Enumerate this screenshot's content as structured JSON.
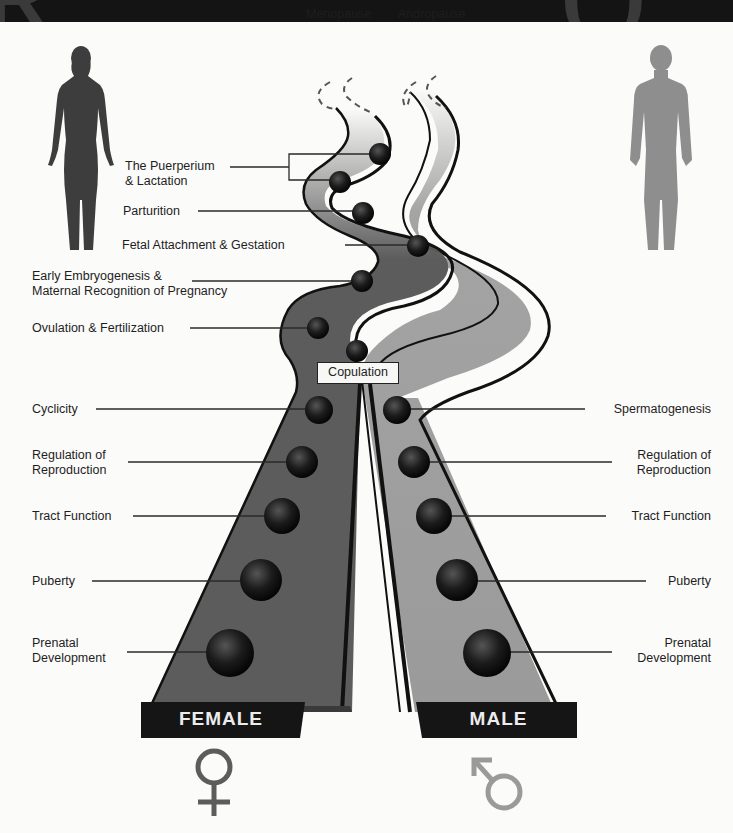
{
  "colors": {
    "female_path": "#5c5c5c",
    "male_path": "#9a9a9a",
    "outline": "#111111",
    "node": "#1a1a1a",
    "female_symbol": "#5c5c5c",
    "male_symbol": "#9a9a9a",
    "background": "#fbfbfa",
    "top_band": "#141414"
  },
  "top_labels": {
    "menopause": "Menopause",
    "andropause": "Andropause"
  },
  "center_label": "Copulation",
  "female": {
    "base_label": "FEMALE",
    "symbol_icon": "female-symbol-icon",
    "silhouette_icon": "female-silhouette-icon",
    "upper_stages": [
      {
        "label": "The Puerperium",
        "label2": "& Lactation"
      },
      {
        "label": "Parturition"
      },
      {
        "label": "Fetal Attachment & Gestation"
      },
      {
        "label": "Early Embryogenesis &",
        "label2": "Maternal Recognition of Pregnancy"
      },
      {
        "label": "Ovulation & Fertilization"
      }
    ],
    "lower_stages": [
      {
        "label": "Cyclicity"
      },
      {
        "label": "Regulation of",
        "label2": "Reproduction"
      },
      {
        "label": "Tract Function"
      },
      {
        "label": "Puberty"
      },
      {
        "label": "Prenatal",
        "label2": "Development"
      }
    ]
  },
  "male": {
    "base_label": "MALE",
    "symbol_icon": "male-symbol-icon",
    "silhouette_icon": "male-silhouette-icon",
    "lower_stages": [
      {
        "label": "Spermatogenesis"
      },
      {
        "label": "Regulation of",
        "label2": "Reproduction"
      },
      {
        "label": "Tract Function"
      },
      {
        "label": "Puberty"
      },
      {
        "label": "Prenatal",
        "label2": "Development"
      }
    ]
  }
}
